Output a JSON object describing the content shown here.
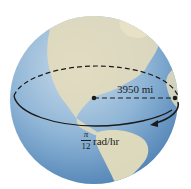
{
  "figure": {
    "radius_label": "3950 mi",
    "angular_speed": {
      "numerator": "π",
      "denominator": "12",
      "unit": "rad/hr"
    },
    "colors": {
      "ocean": "#8fb5d6",
      "ocean_dark": "#5f8fbf",
      "land": "#e3dcbc",
      "line": "#1a1a1a"
    }
  }
}
